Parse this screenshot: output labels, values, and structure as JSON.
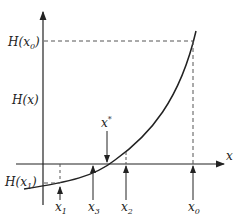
{
  "diagram": {
    "axes": {
      "x_label": "x",
      "y_label": "H(x)"
    },
    "y_labels": {
      "top": {
        "main": "H(x",
        "sub": "0",
        "close": ")"
      },
      "middle": "H(x)",
      "bottom": {
        "main": "H(x",
        "sub": "1",
        "close": ")"
      }
    },
    "x_markers": [
      {
        "name": "x1",
        "main": "x",
        "sub": "1"
      },
      {
        "name": "x3",
        "main": "x",
        "sub": "3"
      },
      {
        "name": "x2",
        "main": "x",
        "sub": "2"
      },
      {
        "name": "x0",
        "main": "x",
        "sub": "0"
      }
    ],
    "root_marker": {
      "label": "x*",
      "main": "x",
      "sup": "*"
    },
    "colors": {
      "line": "#222222",
      "dashed": "#555555"
    }
  }
}
